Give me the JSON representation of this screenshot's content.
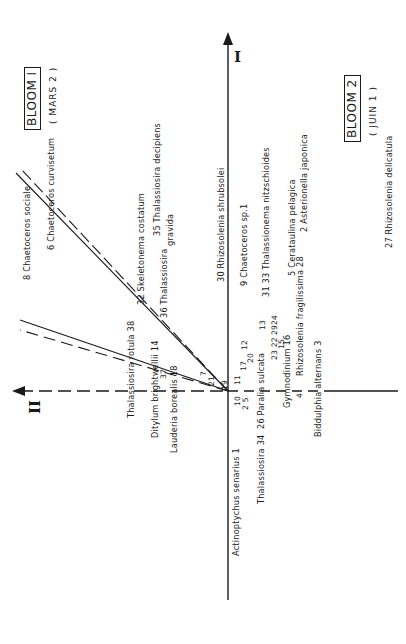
{
  "axes": {
    "axis1_label": "I",
    "axis2_label": "II"
  },
  "blooms": [
    {
      "title": "BLOOM  I",
      "date": "( MARS 2 )"
    },
    {
      "title": "BLOOM  2",
      "date": "( JUIN 1 )"
    }
  ],
  "species_labels": [
    {
      "id": "8",
      "text": "8 Chaetoceros   sociale"
    },
    {
      "id": "6",
      "text": "6 Chaetoceros   curvisetum"
    },
    {
      "id": "32",
      "text": "32 Skeletonema   costatum"
    },
    {
      "id": "35",
      "text": "35 Thalassiosira   decipiens"
    },
    {
      "id": "36",
      "text": "36 Thalassiosira"
    },
    {
      "id": "36b",
      "text": "gravida"
    },
    {
      "id": "30",
      "text": "30 Rhizosolenia   shrubsolei"
    },
    {
      "id": "9",
      "text": "9  Chaetoceros   sp.1"
    },
    {
      "id": "31_33",
      "text": "31 33 Thalassionema   nitzschioides"
    },
    {
      "id": "5",
      "text": "5 Cerataulina   pelagica"
    },
    {
      "id": "28",
      "text": "Rhizosolenia   fragilissima  28"
    },
    {
      "id": "2",
      "text": "2 Asterionella   japonica"
    },
    {
      "id": "27",
      "text": "27  Rhizosolenia    delicatula"
    },
    {
      "id": "38",
      "text": "Thalassiosira  rotula  38"
    },
    {
      "id": "14",
      "text": "Ditylum   brightwellii 14"
    },
    {
      "id": "37",
      "text": "37"
    },
    {
      "id": "18",
      "text": "Lauderia  borealis 18"
    },
    {
      "id": "7",
      "text": "7"
    },
    {
      "id": "21",
      "text": "21"
    },
    {
      "id": "1",
      "text": "Actinoptychus   senarius 1"
    },
    {
      "id": "34",
      "text": "Thalassiosira  34"
    },
    {
      "id": "26",
      "text": "26 Paralia   sulcata"
    },
    {
      "id": "16",
      "text": "Gymnodinium 16"
    },
    {
      "id": "3",
      "text": "Biddulphia   alternans  3"
    },
    {
      "id": "19",
      "text": "19"
    },
    {
      "id": "10",
      "text": "10"
    },
    {
      "id": "11",
      "text": "11"
    },
    {
      "id": "25",
      "text": "2 5"
    },
    {
      "id": "17",
      "text": "17"
    },
    {
      "id": "20",
      "text": "20"
    },
    {
      "id": "12",
      "text": "12"
    },
    {
      "id": "13",
      "text": "13"
    },
    {
      "id": "23_22",
      "text": "23  22"
    },
    {
      "id": "29_24",
      "text": "2924"
    },
    {
      "id": "15",
      "text": "15"
    },
    {
      "id": "4",
      "text": "4"
    }
  ]
}
